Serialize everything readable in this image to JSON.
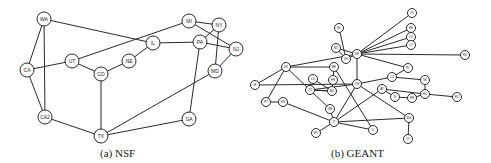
{
  "figures": [
    {
      "id": "nsf",
      "caption": "(a) NSF",
      "caption_pos": [
        100,
        147
      ],
      "node_radius": 7,
      "label_size": 5,
      "nodes": [
        {
          "id": "WA",
          "label": "WA",
          "x": 44,
          "y": 19
        },
        {
          "id": "CA",
          "label": "CA",
          "x": 27,
          "y": 70
        },
        {
          "id": "CA2",
          "label": "CA2",
          "x": 45,
          "y": 117
        },
        {
          "id": "UT",
          "label": "UT",
          "x": 72,
          "y": 61
        },
        {
          "id": "CO",
          "label": "CO",
          "x": 101,
          "y": 74
        },
        {
          "id": "NE",
          "label": "NE",
          "x": 129,
          "y": 61
        },
        {
          "id": "IL",
          "label": "IL",
          "x": 153,
          "y": 43
        },
        {
          "id": "MI",
          "label": "MI",
          "x": 189,
          "y": 21
        },
        {
          "id": "NY",
          "label": "NY",
          "x": 219,
          "y": 25
        },
        {
          "id": "PA",
          "label": "PA",
          "x": 200,
          "y": 42
        },
        {
          "id": "NJ",
          "label": "NJ",
          "x": 236,
          "y": 49
        },
        {
          "id": "MD",
          "label": "MD",
          "x": 215,
          "y": 71
        },
        {
          "id": "GA",
          "label": "GA",
          "x": 189,
          "y": 119
        },
        {
          "id": "TX",
          "label": "TX",
          "x": 101,
          "y": 136
        }
      ],
      "edges": [
        [
          "WA",
          "CA"
        ],
        [
          "WA",
          "CA2"
        ],
        [
          "WA",
          "IL"
        ],
        [
          "CA",
          "UT"
        ],
        [
          "CA",
          "CA2"
        ],
        [
          "UT",
          "MI"
        ],
        [
          "UT",
          "CO"
        ],
        [
          "CO",
          "NE"
        ],
        [
          "CO",
          "TX"
        ],
        [
          "NE",
          "IL"
        ],
        [
          "IL",
          "PA"
        ],
        [
          "MI",
          "NY"
        ],
        [
          "MI",
          "NJ"
        ],
        [
          "NY",
          "MD"
        ],
        [
          "NY",
          "PA"
        ],
        [
          "PA",
          "NJ"
        ],
        [
          "PA",
          "GA"
        ],
        [
          "NJ",
          "MD"
        ],
        [
          "MD",
          "TX"
        ],
        [
          "CA2",
          "TX"
        ],
        [
          "GA",
          "TX"
        ]
      ]
    },
    {
      "id": "geant",
      "caption": "(b) GEANT",
      "caption_pos": [
        331,
        147
      ],
      "node_radius": 4.5,
      "label_size": 3,
      "nodes": [
        {
          "id": "n1",
          "label": "IS",
          "x": 412,
          "y": 13
        },
        {
          "id": "n2",
          "label": "EE",
          "x": 411,
          "y": 28
        },
        {
          "id": "n3",
          "label": "LV",
          "x": 411,
          "y": 37
        },
        {
          "id": "n4",
          "label": "LT",
          "x": 411,
          "y": 45
        },
        {
          "id": "n5",
          "label": "RU",
          "x": 465,
          "y": 55
        },
        {
          "id": "n6",
          "label": "NL",
          "x": 339,
          "y": 28
        },
        {
          "id": "n7",
          "label": "NO",
          "x": 336,
          "y": 48
        },
        {
          "id": "n8",
          "label": "DK",
          "x": 346,
          "y": 59
        },
        {
          "id": "n9",
          "label": "DE",
          "x": 357,
          "y": 54
        },
        {
          "id": "n10",
          "label": "PL",
          "x": 408,
          "y": 68
        },
        {
          "id": "n11",
          "label": "UK",
          "x": 286,
          "y": 67
        },
        {
          "id": "n12",
          "label": "BE",
          "x": 334,
          "y": 67
        },
        {
          "id": "n13",
          "label": "IE",
          "x": 255,
          "y": 85
        },
        {
          "id": "n14",
          "label": "LU",
          "x": 313,
          "y": 79
        },
        {
          "id": "n15",
          "label": "FR",
          "x": 333,
          "y": 80
        },
        {
          "id": "n16",
          "label": "CH",
          "x": 357,
          "y": 84
        },
        {
          "id": "n17",
          "label": "CZ",
          "x": 392,
          "y": 77
        },
        {
          "id": "n18",
          "label": "SK",
          "x": 425,
          "y": 80
        },
        {
          "id": "n19",
          "label": "AT",
          "x": 382,
          "y": 89
        },
        {
          "id": "n20",
          "label": "SI",
          "x": 395,
          "y": 97
        },
        {
          "id": "n21",
          "label": "HR",
          "x": 412,
          "y": 98
        },
        {
          "id": "n22",
          "label": "HU",
          "x": 425,
          "y": 94
        },
        {
          "id": "n23",
          "label": "RO",
          "x": 457,
          "y": 97
        },
        {
          "id": "n24",
          "label": "PT",
          "x": 266,
          "y": 102
        },
        {
          "id": "n25",
          "label": "ES",
          "x": 283,
          "y": 102
        },
        {
          "id": "n26",
          "label": "IT2",
          "x": 310,
          "y": 90
        },
        {
          "id": "n27",
          "label": "MC",
          "x": 332,
          "y": 91
        },
        {
          "id": "n28",
          "label": "GR",
          "x": 330,
          "y": 109
        },
        {
          "id": "n29",
          "label": "IT",
          "x": 334,
          "y": 122
        },
        {
          "id": "n30",
          "label": "MT",
          "x": 316,
          "y": 133
        },
        {
          "id": "n31",
          "label": "IL",
          "x": 373,
          "y": 130
        },
        {
          "id": "n32",
          "label": "BG",
          "x": 409,
          "y": 118
        },
        {
          "id": "n33",
          "label": "CY",
          "x": 408,
          "y": 139
        }
      ],
      "edges": [
        [
          "n9",
          "n1"
        ],
        [
          "n9",
          "n2"
        ],
        [
          "n9",
          "n3"
        ],
        [
          "n9",
          "n4"
        ],
        [
          "n9",
          "n5"
        ],
        [
          "n9",
          "n8"
        ],
        [
          "n9",
          "n7"
        ],
        [
          "n9",
          "n10"
        ],
        [
          "n9",
          "n16"
        ],
        [
          "n9",
          "n11"
        ],
        [
          "n6",
          "n8"
        ],
        [
          "n7",
          "n8"
        ],
        [
          "n11",
          "n13"
        ],
        [
          "n11",
          "n12"
        ],
        [
          "n11",
          "n24"
        ],
        [
          "n11",
          "n26"
        ],
        [
          "n12",
          "n27"
        ],
        [
          "n12",
          "n31"
        ],
        [
          "n13",
          "n16"
        ],
        [
          "n14",
          "n27"
        ],
        [
          "n16",
          "n17"
        ],
        [
          "n16",
          "n26"
        ],
        [
          "n16",
          "n29"
        ],
        [
          "n16",
          "n32"
        ],
        [
          "n17",
          "n18"
        ],
        [
          "n17",
          "n10"
        ],
        [
          "n18",
          "n22"
        ],
        [
          "n19",
          "n20"
        ],
        [
          "n19",
          "n22"
        ],
        [
          "n19",
          "n29"
        ],
        [
          "n20",
          "n21"
        ],
        [
          "n21",
          "n22"
        ],
        [
          "n22",
          "n23"
        ],
        [
          "n24",
          "n25"
        ],
        [
          "n25",
          "n29"
        ],
        [
          "n26",
          "n27"
        ],
        [
          "n26",
          "n28"
        ],
        [
          "n27",
          "n15"
        ],
        [
          "n27",
          "n26"
        ],
        [
          "n28",
          "n29"
        ],
        [
          "n29",
          "n30"
        ],
        [
          "n29",
          "n31"
        ],
        [
          "n29",
          "n32"
        ],
        [
          "n32",
          "n33"
        ]
      ]
    }
  ]
}
